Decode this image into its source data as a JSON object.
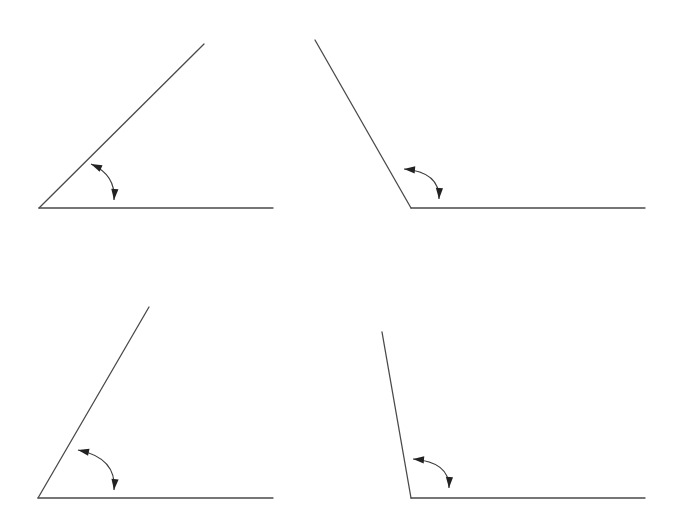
{
  "figure": {
    "colors": {
      "line": "#4a4a4a",
      "arrow": "#222222",
      "background": "#ffffff"
    },
    "angles": [
      {
        "id": "angle-1",
        "type": "acute",
        "vertex": [
          39,
          208
        ],
        "baseline_end": [
          273,
          208
        ],
        "ray_end": [
          204,
          44
        ],
        "arrow": {
          "start": [
            91,
            164
          ],
          "control": [
            116,
            175
          ],
          "end": [
            114,
            200
          ]
        }
      },
      {
        "id": "angle-2",
        "type": "obtuse",
        "vertex": [
          411,
          208
        ],
        "baseline_end": [
          645,
          208
        ],
        "ray_end": [
          315,
          40
        ],
        "arrow": {
          "start": [
            404,
            169
          ],
          "control": [
            440,
            172
          ],
          "end": [
            439,
            199
          ]
        }
      },
      {
        "id": "angle-3",
        "type": "acute",
        "vertex": [
          38,
          498
        ],
        "baseline_end": [
          273,
          498
        ],
        "ray_end": [
          149,
          307
        ],
        "arrow": {
          "start": [
            78,
            450
          ],
          "control": [
            117,
            458
          ],
          "end": [
            114,
            490
          ]
        }
      },
      {
        "id": "angle-4",
        "type": "obtuse",
        "vertex": [
          411,
          498
        ],
        "baseline_end": [
          645,
          498
        ],
        "ray_end": [
          382,
          332
        ],
        "arrow": {
          "start": [
            413,
            459
          ],
          "control": [
            450,
            462
          ],
          "end": [
            449,
            488
          ]
        }
      }
    ]
  }
}
